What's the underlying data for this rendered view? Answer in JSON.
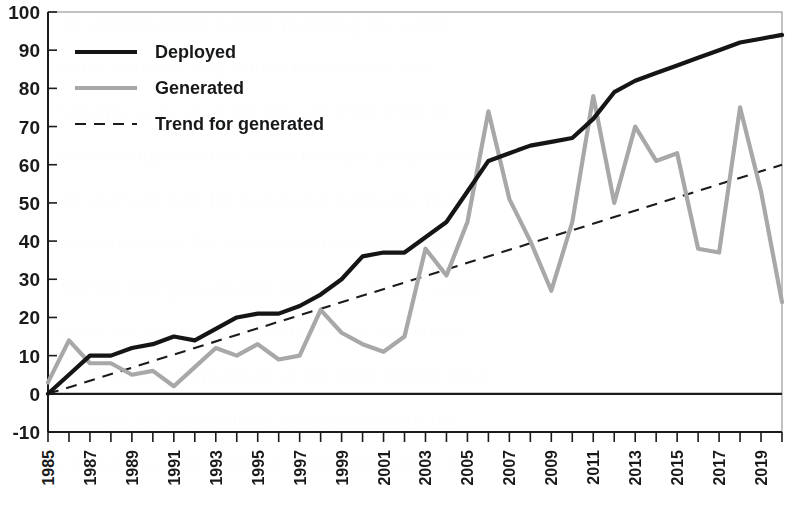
{
  "chart_data": {
    "type": "line",
    "title": "",
    "subtitle": "",
    "xlabel": "",
    "ylabel": "",
    "grid": false,
    "legend_position": "top-left",
    "xlim": [
      1985,
      2020
    ],
    "ylim": [
      -10,
      100
    ],
    "ytick_values": [
      -10,
      0,
      10,
      20,
      30,
      40,
      50,
      60,
      70,
      80,
      90,
      100
    ],
    "ytick_labels": [
      "-10",
      "0",
      "10",
      "20",
      "30",
      "40",
      "50",
      "60",
      "70",
      "80",
      "90",
      "100"
    ],
    "x": [
      1985,
      1986,
      1987,
      1988,
      1989,
      1990,
      1991,
      1992,
      1993,
      1994,
      1995,
      1996,
      1997,
      1998,
      1999,
      2000,
      2001,
      2002,
      2003,
      2004,
      2005,
      2006,
      2007,
      2008,
      2009,
      2010,
      2011,
      2012,
      2013,
      2014,
      2015,
      2016,
      2017,
      2018,
      2019,
      2020
    ],
    "xtick_labels": [
      "1985",
      "1987",
      "1989",
      "1991",
      "1993",
      "1995",
      "1997",
      "1999",
      "2001",
      "2003",
      "2005",
      "2007",
      "2009",
      "2011",
      "2013",
      "2015",
      "2017",
      "2019"
    ],
    "xtick_values": [
      1985,
      1987,
      1989,
      1991,
      1993,
      1995,
      1997,
      1999,
      2001,
      2003,
      2005,
      2007,
      2009,
      2011,
      2013,
      2015,
      2017,
      2019
    ],
    "series": [
      {
        "name": "Deployed",
        "color": "#151515",
        "style": "solid",
        "values": [
          0,
          5,
          10,
          10,
          12,
          13,
          15,
          14,
          17,
          20,
          21,
          21,
          23,
          26,
          30,
          36,
          37,
          37,
          41,
          45,
          53,
          61,
          63,
          65,
          66,
          67,
          72,
          79,
          82,
          84,
          86,
          88,
          90,
          92,
          93,
          94
        ]
      },
      {
        "name": "Generated",
        "color": "#a8a8a8",
        "style": "solid",
        "values": [
          3,
          14,
          8,
          8,
          5,
          6,
          2,
          7,
          12,
          10,
          13,
          9,
          10,
          22,
          16,
          13,
          11,
          15,
          38,
          31,
          45,
          74,
          51,
          40,
          27,
          45,
          78,
          50,
          70,
          61,
          63,
          38,
          37,
          75,
          53,
          24
        ]
      }
    ],
    "trend": {
      "name": "Trend for generated",
      "color": "#1b1b1b",
      "style": "dashed",
      "x": [
        1985,
        2020
      ],
      "values": [
        0,
        60
      ]
    },
    "legend": [
      {
        "label": "Deployed",
        "style": "solid",
        "color": "#151515"
      },
      {
        "label": "Generated",
        "style": "solid",
        "color": "#a8a8a8"
      },
      {
        "label": "Trend for generated",
        "style": "dashed",
        "color": "#1b1b1b"
      }
    ]
  },
  "colors": {
    "deployed": "#151515",
    "generated": "#a8a8a8",
    "trend": "#1b1b1b",
    "axis": "#1b1b1b",
    "background": "#ffffff"
  }
}
